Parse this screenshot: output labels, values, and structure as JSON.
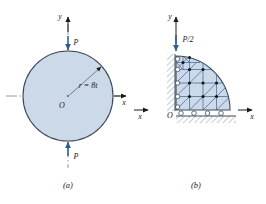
{
  "figure": {
    "panels": [
      {
        "id": "a",
        "caption": "(a)",
        "shape": "full-circle",
        "origin_label": "O",
        "axis_x_label": "x",
        "axis_y_label": "y",
        "radius_label": "r = 8t",
        "load_top_label": "P",
        "load_bottom_label": "P",
        "load_direction": "inward-compression"
      },
      {
        "id": "b",
        "caption": "(b)",
        "shape": "quarter-disc-mesh",
        "origin_label": "O",
        "axis_x_label_left": "x",
        "axis_x_label_right": "x",
        "axis_y_label": "y",
        "load_label": "P/2",
        "load_direction": "downward",
        "support_bottom": "rollers-on-hatched-ground",
        "support_left": "rollers-on-hatched-wall"
      }
    ],
    "colors": {
      "fill": "#ccd9e8",
      "fill_dark": "#b9cbdf",
      "outline": "#3b4a5a",
      "arrow": "#2a5d96",
      "mesh_line": "#4a6versa",
      "mesh": "#5b7da6",
      "node": "#101820",
      "centerline": "#8a9099",
      "hatch": "#9aa3ad",
      "text": "#1b1b1b"
    }
  }
}
